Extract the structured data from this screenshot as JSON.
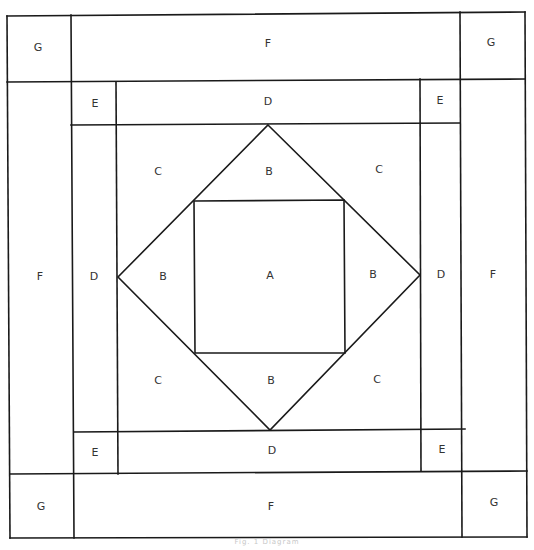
{
  "diagram": {
    "type": "quilt-block-layout",
    "caption": "Fig. 1  Diagram",
    "line_color": "#1a1a1a",
    "label_color": "#333333",
    "labels": {
      "g_top_left": "G",
      "f_top": "F",
      "g_top_right": "G",
      "e_top_left": "E",
      "d_top": "D",
      "e_top_right": "E",
      "c_top_left": "C",
      "b_top": "B",
      "c_top_right": "C",
      "f_left": "F",
      "d_left": "D",
      "b_left": "B",
      "a_center": "A",
      "b_right": "B",
      "d_right": "D",
      "f_right": "F",
      "c_bottom_left": "C",
      "b_bottom": "B",
      "c_bottom_right": "C",
      "e_bottom_left": "E",
      "d_bottom": "D",
      "e_bottom_right": "E",
      "g_bottom_left": "G",
      "f_bottom": "F",
      "g_bottom_right": "G"
    },
    "pieces": [
      {
        "id": "A",
        "shape": "center square"
      },
      {
        "id": "B",
        "shape": "setting triangles around A (4)"
      },
      {
        "id": "C",
        "shape": "corner triangles (4)"
      },
      {
        "id": "D",
        "shape": "inner border strips (4)"
      },
      {
        "id": "E",
        "shape": "inner corner squares (4)"
      },
      {
        "id": "F",
        "shape": "outer border strips (4)"
      },
      {
        "id": "G",
        "shape": "outer corner squares (4)"
      }
    ]
  }
}
